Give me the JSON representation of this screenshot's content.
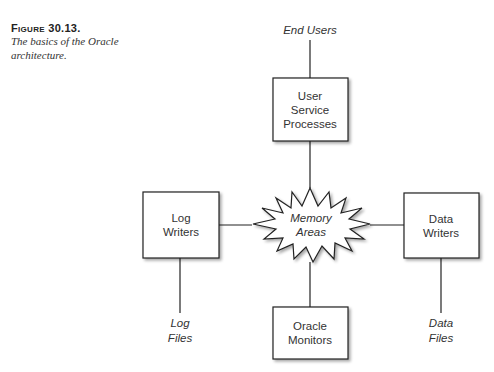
{
  "caption": {
    "label": "Figure 30.13.",
    "text_line1": "The basics of the Oracle",
    "text_line2": "architecture."
  },
  "diagram": {
    "center": {
      "line1": "Memory",
      "line2": "Areas"
    },
    "boxes": {
      "top": {
        "line1": "User",
        "line2": "Service",
        "line3": "Processes"
      },
      "left": {
        "line1": "Log",
        "line2": "Writers"
      },
      "right": {
        "line1": "Data",
        "line2": "Writers"
      },
      "bottom": {
        "line1": "Oracle",
        "line2": "Monitors"
      }
    },
    "external": {
      "top": {
        "line1": "End Users"
      },
      "left": {
        "line1": "Log",
        "line2": "Files"
      },
      "right": {
        "line1": "Data",
        "line2": "Files"
      }
    },
    "colors": {
      "stroke": "#222222",
      "shadow": "#bbbbbb",
      "fill": "#ffffff"
    }
  }
}
